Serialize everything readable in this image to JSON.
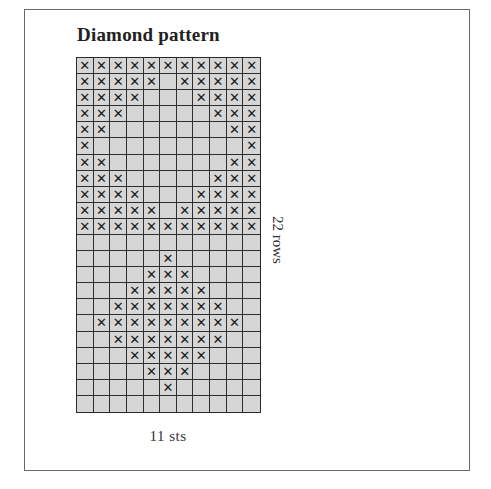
{
  "title": "Diamond pattern",
  "rows_label": "22 rows",
  "stitches_label": "11 sts",
  "colors": {
    "cell_fill": "#d6d6d6",
    "grid_line": "#2e2e2e",
    "mark": "#1a1a1a",
    "frame": "#6a6a6a"
  },
  "mark_symbol": "✕",
  "grid": {
    "columns": 11,
    "rows": 22,
    "pattern": [
      "XXXXXXXXXXX",
      "XXXXX.XXXXX",
      "XXXX...XXXX",
      "XXX.....XXX",
      "XX.......XX",
      "X.........X",
      "XX.......XX",
      "XXX.....XXX",
      "XXXX...XXXX",
      "XXXXX.XXXXX",
      "XXXXXXXXXXX",
      "...........",
      ".....X.....",
      "....XXX....",
      "...XXXXX...",
      "..XXXXXXX..",
      ".XXXXXXXXX.",
      "..XXXXXXX..",
      "...XXXXX...",
      "....XXX....",
      ".....X.....",
      "..........."
    ]
  }
}
